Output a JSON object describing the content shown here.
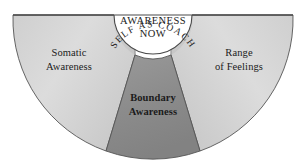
{
  "diagram": {
    "type": "semicircle-segment-diagram",
    "core": {
      "line1": "AWARENESS",
      "line2": "NOW"
    },
    "arc_band": {
      "label": "SELF AS COACH"
    },
    "segments": [
      {
        "id": "somatic-awareness",
        "line1": "Somatic",
        "line2": "Awareness",
        "fill": "#d9d9d9",
        "position": "left"
      },
      {
        "id": "boundary-awareness",
        "line1": "Boundary",
        "line2": "Awareness",
        "fill": "#8d8d8d",
        "position": "center",
        "bold": true
      },
      {
        "id": "range-of-feelings",
        "line1": "Range",
        "line2": "of Feelings",
        "fill": "#d9d9d9",
        "position": "right"
      }
    ],
    "colors": {
      "outline": "#4a4a4a",
      "core_fill": "#ffffff",
      "light_segment": "#d9d9d9",
      "dark_segment": "#8d8d8d",
      "text": "#1b1b1b",
      "background": "#ffffff"
    }
  }
}
